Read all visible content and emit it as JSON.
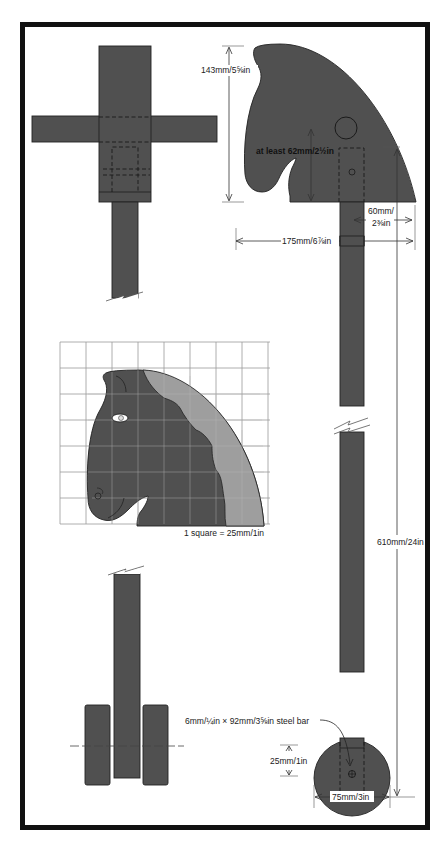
{
  "colors": {
    "wood": "#505050",
    "mane": "#9e9e9e",
    "frame": "#111111",
    "grid": "#9a9a9a",
    "background": "#ffffff"
  },
  "front_view": {
    "label": "front view of head, handle and stick"
  },
  "side_view": {
    "dims": {
      "head_height": "143mm/5⅝in",
      "socket_depth": "at least 62mm/2½in",
      "handle_offset": "60mm/\n2⅜in",
      "handle_offset_line1": "60mm/",
      "handle_offset_line2": "2⅜in",
      "head_width": "175mm/6⅞in",
      "stick_length": "610mm/24in"
    }
  },
  "pattern": {
    "grid_columns": 8,
    "grid_rows": 7,
    "scale_label": "1 square = 25mm/1in"
  },
  "wheel": {
    "axle_label": "6mm/¼in × 92mm/3⅝in steel bar",
    "axle_height": "25mm/1in",
    "wheel_diameter": "75mm/3in"
  }
}
